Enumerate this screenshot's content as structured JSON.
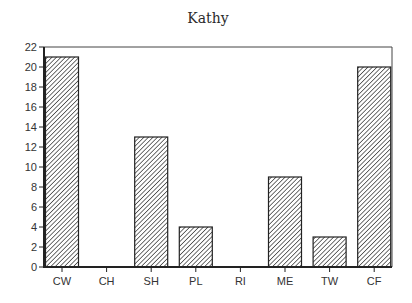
{
  "chart_data": {
    "type": "bar",
    "title": "Kathy",
    "xlabel": "",
    "ylabel": "",
    "categories": [
      "CW",
      "CH",
      "SH",
      "PL",
      "RI",
      "ME",
      "TW",
      "CF"
    ],
    "values": [
      21,
      0,
      13,
      4,
      0,
      9,
      3,
      20
    ],
    "ylim": [
      0,
      22
    ],
    "yticks": [
      0,
      2,
      4,
      6,
      8,
      10,
      12,
      14,
      16,
      18,
      20,
      22
    ],
    "grid": false,
    "legend": null,
    "bar_fill": "diagonal-hatch",
    "colors": {
      "line": "#222222",
      "hatch": "#333333",
      "background": "#ffffff"
    }
  }
}
